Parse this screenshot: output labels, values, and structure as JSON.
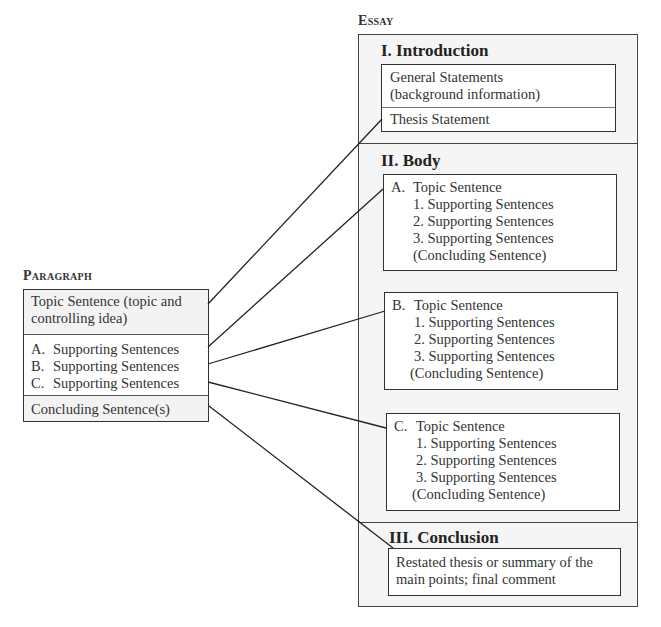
{
  "headings": {
    "essay": "Essay",
    "paragraph": "Paragraph"
  },
  "paragraph": {
    "topic": "Topic Sentence (topic and controlling idea)",
    "topic_lines": [
      "Topic Sentence (topic and",
      "controlling idea)"
    ],
    "supporting": [
      {
        "marker": "A.",
        "text": "Supporting Sentences"
      },
      {
        "marker": "B.",
        "text": "Supporting Sentences"
      },
      {
        "marker": "C.",
        "text": "Supporting Sentences"
      }
    ],
    "concluding": "Concluding Sentence(s)"
  },
  "essay": {
    "introduction": {
      "title": "I. Introduction",
      "general_lines": [
        "General Statements",
        "(background information)"
      ],
      "thesis": "Thesis Statement"
    },
    "body": {
      "title": "II. Body",
      "paragraphs": [
        {
          "marker": "A.",
          "topic": "Topic Sentence",
          "supporting": [
            "1.  Supporting Sentences",
            "2.  Supporting Sentences",
            "3.  Supporting Sentences"
          ],
          "concluding": "(Concluding Sentence)"
        },
        {
          "marker": "B.",
          "topic": "Topic Sentence",
          "supporting": [
            "1.  Supporting Sentences",
            "2.  Supporting Sentences",
            "3.  Supporting Sentences"
          ],
          "concluding": "(Concluding Sentence)"
        },
        {
          "marker": "C.",
          "topic": "Topic Sentence",
          "supporting": [
            "1.  Supporting Sentences",
            "2.  Supporting Sentences",
            "3.  Supporting Sentences"
          ],
          "concluding": "(Concluding Sentence)"
        }
      ]
    },
    "conclusion": {
      "title": "III. Conclusion",
      "lines": [
        "Restated thesis or summary of the",
        "main points; final comment"
      ]
    }
  },
  "connectors": [
    {
      "from": "paragraph.topic",
      "to": "essay.introduction.thesis"
    },
    {
      "from": "paragraph.supporting.A",
      "to": "essay.body.A"
    },
    {
      "from": "paragraph.supporting.B",
      "to": "essay.body.B"
    },
    {
      "from": "paragraph.supporting.C",
      "to": "essay.body.C"
    },
    {
      "from": "paragraph.concluding",
      "to": "essay.conclusion"
    }
  ],
  "colors": {
    "line": "#222222",
    "border": "#333333",
    "section_bg": "#f5f5f5",
    "box_bg": "#ffffff"
  }
}
